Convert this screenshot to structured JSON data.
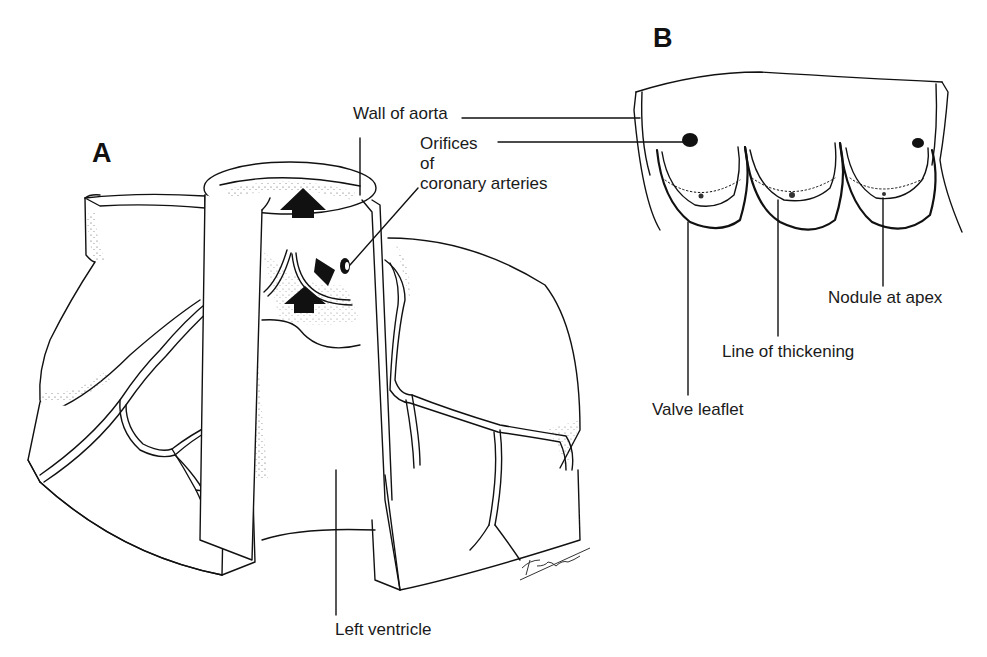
{
  "figure": {
    "panels": [
      {
        "id": "A",
        "letter": "A",
        "description": "Cutaway of aortic root showing aortic valve cusps, coronary artery orifices, and blood-flow arrows from the left ventricle"
      },
      {
        "id": "B",
        "letter": "B",
        "description": "Aortic valve opened flat showing three semilunar cusps"
      }
    ],
    "labels": {
      "wall_of_aorta": "Wall of aorta",
      "orifices_line1": "Orifices",
      "orifices_line2": "of",
      "orifices_line3": "coronary arteries",
      "nodule_at_apex": "Nodule at apex",
      "line_of_thickening": "Line of thickening",
      "valve_leaflet": "Valve leaflet",
      "left_ventricle": "Left ventricle"
    },
    "signature": "Darwin",
    "colors": {
      "ink": "#111111",
      "paper": "#ffffff"
    }
  }
}
